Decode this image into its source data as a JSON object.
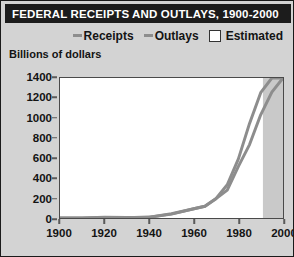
{
  "figure": {
    "title": "FEDERAL RECEIPTS AND OUTLAYS, 1900-2000",
    "unit_label": "Billions of dollars",
    "colors": {
      "title_bar": "#1c1c1c",
      "title_text": "#ffffff",
      "background": "#d3d3d3",
      "plot_background": "#ffffff",
      "line": "#8d8d8d",
      "estimated_band": "#c9c9c9",
      "axis": "#4a4a4a"
    }
  },
  "legend": {
    "entries": [
      {
        "label": "Receipts",
        "marker": "line-dash-icon",
        "color": "#8d8d8d"
      },
      {
        "label": "Outlays",
        "marker": "line-dash-icon",
        "color": "#8d8d8d"
      },
      {
        "label": "Estimated",
        "marker": "square-swatch-icon",
        "color": "#ffffff"
      }
    ]
  },
  "chart_data": {
    "type": "line",
    "title": "FEDERAL RECEIPTS AND OUTLAYS, 1900-2000",
    "xlabel": "",
    "ylabel": "Billions of dollars",
    "xlim": [
      1900,
      2000
    ],
    "ylim": [
      0,
      1400
    ],
    "xticks": [
      1900,
      1920,
      1940,
      1960,
      1980,
      2000
    ],
    "yticks": [
      0,
      200,
      400,
      600,
      800,
      1000,
      1200,
      1400
    ],
    "grid": false,
    "legend_position": "top-right",
    "estimated_region": {
      "from": 1991,
      "to": 2000,
      "label": "Estimated"
    },
    "x": [
      1900,
      1910,
      1920,
      1930,
      1940,
      1950,
      1960,
      1965,
      1970,
      1975,
      1980,
      1985,
      1990,
      1995,
      2000
    ],
    "series": [
      {
        "name": "Receipts",
        "color": "#8d8d8d",
        "values": [
          1,
          1,
          7,
          4,
          7,
          39,
          92,
          117,
          193,
          279,
          517,
          734,
          1032,
          1259,
          1400
        ]
      },
      {
        "name": "Outlays",
        "color": "#8d8d8d",
        "values": [
          1,
          1,
          6,
          3,
          9,
          43,
          92,
          118,
          196,
          332,
          591,
          946,
          1253,
          1519,
          1800
        ]
      }
    ]
  },
  "axes": {
    "ytick_labels": [
      "1400",
      "1200",
      "1000",
      "800",
      "600",
      "400",
      "200",
      "0"
    ],
    "xtick_labels": [
      "1900",
      "1920",
      "1940",
      "1960",
      "1980",
      "2000"
    ]
  }
}
